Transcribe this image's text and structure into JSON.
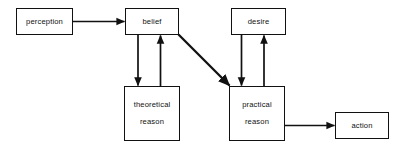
{
  "diagram": {
    "stroke_color": "#111111",
    "background_color": "#ffffff",
    "nodes": [
      {
        "id": "perception",
        "label": "perception",
        "lines": [
          "perception"
        ]
      },
      {
        "id": "belief",
        "label": "belief",
        "lines": [
          "belief"
        ]
      },
      {
        "id": "desire",
        "label": "desire",
        "lines": [
          "desire"
        ]
      },
      {
        "id": "theoretical",
        "label": "theoretical reason",
        "lines": [
          "theoretical",
          "reason"
        ]
      },
      {
        "id": "practical",
        "label": "practical reason",
        "lines": [
          "practical",
          "reason"
        ]
      },
      {
        "id": "action",
        "label": "action",
        "lines": [
          "action"
        ]
      }
    ],
    "edges": [
      {
        "id": "perception-to-belief",
        "from": "perception",
        "to": "belief",
        "style": "straight-horizontal"
      },
      {
        "id": "belief-to-theoretical",
        "from": "belief",
        "to": "theoretical",
        "style": "straight-vertical"
      },
      {
        "id": "theoretical-to-belief",
        "from": "theoretical",
        "to": "belief",
        "style": "straight-vertical"
      },
      {
        "id": "belief-to-practical",
        "from": "belief",
        "to": "practical",
        "style": "diagonal"
      },
      {
        "id": "desire-to-practical",
        "from": "desire",
        "to": "practical",
        "style": "straight-vertical"
      },
      {
        "id": "practical-to-desire",
        "from": "practical",
        "to": "desire",
        "style": "straight-vertical"
      },
      {
        "id": "practical-to-action",
        "from": "practical",
        "to": "action",
        "style": "straight-horizontal"
      }
    ]
  }
}
